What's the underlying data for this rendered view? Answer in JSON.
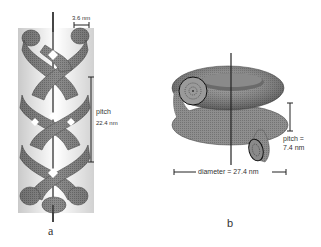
{
  "figure": {
    "panels": [
      {
        "id": "a",
        "letter": "a",
        "subject": "triple-helix-braid",
        "labels": {
          "strand_width": "3.6 nm",
          "pitch_title": "pitch",
          "pitch_value": "22.4 nm"
        }
      },
      {
        "id": "b",
        "letter": "b",
        "subject": "helical-coil-torus",
        "labels": {
          "pitch_title": "pitch =",
          "pitch_value": "7.4 nm",
          "diameter": "diameter = 27.4 nm"
        }
      }
    ],
    "colors": {
      "surface": "#8a8a8a",
      "surface_dark": "#5a5a5a",
      "surface_light": "#b5b5b5",
      "lines": "#222222",
      "background": "#ffffff"
    }
  }
}
